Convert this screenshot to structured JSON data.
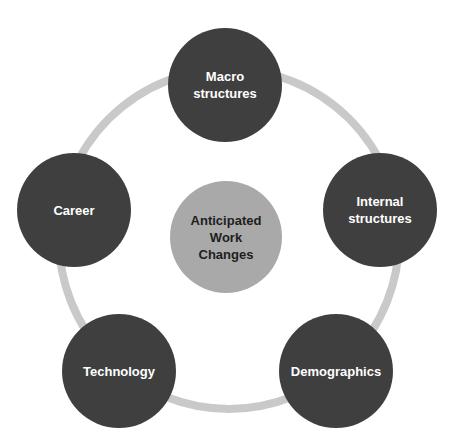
{
  "diagram": {
    "type": "hub-and-cycle",
    "center": {
      "label": "Anticipated\nWork\nChanges",
      "color": "#a9a9a9"
    },
    "nodes": [
      {
        "label": "Macro\nstructures",
        "position": "top"
      },
      {
        "label": "Internal\nstructures",
        "position": "right"
      },
      {
        "label": "Demographics",
        "position": "bottom-right"
      },
      {
        "label": "Technology",
        "position": "bottom-left"
      },
      {
        "label": "Career",
        "position": "left"
      }
    ],
    "colors": {
      "node": "#3f3f3f",
      "ring": "#c9c9c9",
      "node_text": "#ffffff",
      "center_text": "#1e1e1e"
    }
  }
}
